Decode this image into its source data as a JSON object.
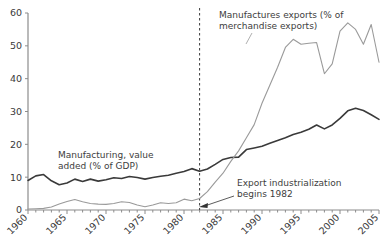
{
  "chart_data": {
    "type": "line",
    "title": "",
    "subtitle": "",
    "xlabel": "",
    "ylabel": "",
    "xlim": [
      1960,
      2005
    ],
    "ylim": [
      0,
      60
    ],
    "grid": false,
    "legend_position": "inline-annotations",
    "y_ticks": [
      0,
      10,
      20,
      30,
      40,
      50,
      60
    ],
    "y_tick_labels": [
      "0",
      "10",
      "20",
      "30",
      "40",
      "50",
      "60"
    ],
    "x_ticks": [
      1960,
      1965,
      1970,
      1975,
      1980,
      1985,
      1990,
      1995,
      2000,
      2005
    ],
    "x_tick_labels": [
      "1960",
      "1965",
      "1970",
      "1975",
      "1980",
      "1985",
      "1990",
      "1995",
      "2000",
      "2005"
    ],
    "x_minor_tick_interval": 1,
    "series": [
      {
        "name": "Manufacturing, value added (% of GDP)",
        "color": "#3a3a3a",
        "width": 1.6,
        "x": [
          1960,
          1961,
          1962,
          1963,
          1964,
          1965,
          1966,
          1967,
          1968,
          1969,
          1970,
          1971,
          1972,
          1973,
          1974,
          1975,
          1976,
          1977,
          1978,
          1979,
          1980,
          1981,
          1982,
          1983,
          1984,
          1985,
          1986,
          1987,
          1988,
          1989,
          1990,
          1991,
          1992,
          1993,
          1994,
          1995,
          1996,
          1997,
          1998,
          1999,
          2000,
          2001,
          2002,
          2003,
          2004,
          2005
        ],
        "y": [
          9.0,
          10.4,
          10.8,
          8.9,
          7.7,
          8.2,
          9.4,
          8.7,
          9.4,
          8.8,
          9.2,
          9.8,
          9.6,
          10.2,
          9.9,
          9.4,
          9.9,
          10.3,
          10.6,
          11.2,
          11.7,
          12.6,
          11.8,
          12.5,
          13.9,
          15.4,
          16.0,
          16.1,
          18.4,
          18.9,
          19.4,
          20.3,
          21.2,
          22.0,
          23.0,
          23.7,
          24.6,
          25.9,
          24.7,
          25.9,
          27.9,
          30.2,
          31.0,
          30.3,
          29.0,
          27.6
        ]
      },
      {
        "name": "Manufactures exports (% of merchandise exports)",
        "color": "#9a9a9a",
        "width": 1.1,
        "x": [
          1960,
          1961,
          1962,
          1963,
          1964,
          1965,
          1966,
          1967,
          1968,
          1969,
          1970,
          1971,
          1972,
          1973,
          1974,
          1975,
          1976,
          1977,
          1978,
          1979,
          1980,
          1981,
          1982,
          1983,
          1984,
          1985,
          1986,
          1987,
          1988,
          1989,
          1990,
          1991,
          1992,
          1993,
          1994,
          1995,
          1996,
          1997,
          1998,
          1999,
          2000,
          2001,
          2002,
          2003,
          2004,
          2005
        ],
        "y": [
          0.3,
          0.4,
          0.5,
          0.9,
          1.8,
          2.6,
          3.2,
          2.5,
          2.0,
          1.8,
          1.7,
          2.0,
          2.5,
          2.3,
          1.5,
          1.0,
          1.5,
          2.2,
          2.0,
          2.2,
          3.3,
          2.8,
          3.5,
          5.6,
          8.5,
          11.2,
          14.8,
          18.0,
          22.0,
          26.0,
          32.5,
          38.0,
          43.5,
          49.5,
          52.0,
          50.5,
          50.8,
          51.0,
          41.5,
          44.5,
          54.5,
          57.0,
          55.0,
          50.5,
          56.5,
          45.0
        ]
      }
    ],
    "annotations": [
      {
        "id": "manufacturing-value-added-label",
        "text_lines": [
          "Manufacturing, value",
          "added (% of GDP)"
        ],
        "x_px": 58,
        "y_px": 158
      },
      {
        "id": "manufactures-exports-label",
        "text_lines": [
          "Manufactures exports (% of",
          "merchandise exports)"
        ],
        "x_px": 219,
        "y_px": 18
      },
      {
        "id": "export-industrialization-label",
        "text_lines": [
          "Export industrialization",
          "begins 1982"
        ],
        "x_px": 237,
        "y_px": 186
      }
    ],
    "marker_line": {
      "id": "export-industrialization-marker",
      "x_value": 1982,
      "style": "dashed",
      "color": "#3a3a3a",
      "label": "1982"
    },
    "arrow": {
      "id": "export-industrialization-arrow",
      "from_px": [
        234,
        196
      ],
      "to_px": [
        199,
        207
      ]
    }
  },
  "axes": {
    "axis_color": "#8c8c8c",
    "plot_left_px": 28,
    "plot_right_px": 379,
    "plot_top_px": 13,
    "plot_bottom_px": 210
  }
}
